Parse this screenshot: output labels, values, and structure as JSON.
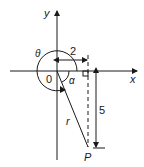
{
  "diagram": {
    "axes": {
      "x_label": "x",
      "y_label": "y",
      "origin_label": "0"
    },
    "angles": {
      "theta_label": "θ",
      "alpha_label": "α"
    },
    "dimensions": {
      "horizontal_label": "2",
      "vertical_label": "5"
    },
    "segment_label": "r",
    "point_label": "P",
    "colors": {
      "line": "#1a1a1a",
      "background": "#ffffff"
    }
  }
}
